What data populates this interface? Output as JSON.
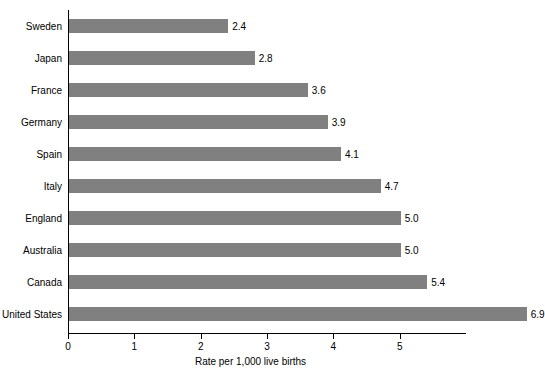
{
  "chart_data": {
    "type": "bar",
    "orientation": "horizontal",
    "title": "",
    "subtitle": "",
    "xlabel": "Rate per 1,000 live births",
    "ylabel": "",
    "categories": [
      "Sweden",
      "Japan",
      "France",
      "Germany",
      "Spain",
      "Italy",
      "England",
      "Australia",
      "Canada",
      "United States"
    ],
    "values": [
      2.4,
      2.8,
      3.6,
      3.9,
      4.1,
      4.7,
      5.0,
      5.0,
      5.4,
      6.9
    ],
    "value_labels": [
      "2.4",
      "2.8",
      "3.6",
      "3.9",
      "4.1",
      "4.7",
      "5.0",
      "5.0",
      "5.4",
      "6.9"
    ],
    "xlim": [
      0,
      6
    ],
    "xticks": [
      0,
      1,
      2,
      3,
      4,
      5
    ],
    "xtick_labels": [
      "0",
      "1",
      "2",
      "3",
      "4",
      "5"
    ],
    "grid": false,
    "legend": null,
    "bar_color": "#808080",
    "axis_color": "#000000",
    "background_color": "#ffffff"
  }
}
